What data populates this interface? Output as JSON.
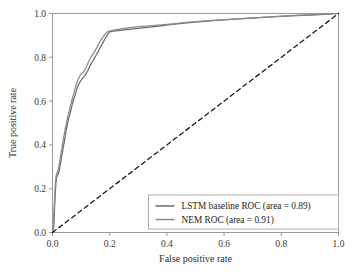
{
  "chart_data": {
    "type": "line",
    "title": "",
    "xlabel": "False positive rate",
    "ylabel": "True positive rate",
    "xlim": [
      0.0,
      1.0
    ],
    "ylim": [
      0.0,
      1.0
    ],
    "grid": false,
    "legend_position": "lower right",
    "xticks": [
      "0.0",
      "0.2",
      "0.4",
      "0.6",
      "0.8",
      "1.0"
    ],
    "yticks": [
      "0.0",
      "0.2",
      "0.4",
      "0.6",
      "0.8",
      "1.0"
    ],
    "xtick_values": [
      0.0,
      0.2,
      0.4,
      0.6,
      0.8,
      1.0
    ],
    "ytick_values": [
      0.0,
      0.2,
      0.4,
      0.6,
      0.8,
      1.0
    ],
    "series": [
      {
        "name": "LSTM baseline ROC (area = 0.89)",
        "area": 0.89,
        "color": "#6b6b6b",
        "linestyle": "solid",
        "points": [
          [
            0.0,
            0.0
          ],
          [
            0.004,
            0.02
          ],
          [
            0.006,
            0.075
          ],
          [
            0.008,
            0.13
          ],
          [
            0.01,
            0.185
          ],
          [
            0.012,
            0.225
          ],
          [
            0.014,
            0.25
          ],
          [
            0.018,
            0.262
          ],
          [
            0.022,
            0.275
          ],
          [
            0.026,
            0.3
          ],
          [
            0.03,
            0.33
          ],
          [
            0.034,
            0.36
          ],
          [
            0.038,
            0.392
          ],
          [
            0.042,
            0.42
          ],
          [
            0.046,
            0.452
          ],
          [
            0.05,
            0.48
          ],
          [
            0.054,
            0.508
          ],
          [
            0.058,
            0.528
          ],
          [
            0.062,
            0.545
          ],
          [
            0.066,
            0.568
          ],
          [
            0.07,
            0.59
          ],
          [
            0.074,
            0.608
          ],
          [
            0.078,
            0.622
          ],
          [
            0.082,
            0.64
          ],
          [
            0.086,
            0.66
          ],
          [
            0.09,
            0.672
          ],
          [
            0.094,
            0.682
          ],
          [
            0.098,
            0.692
          ],
          [
            0.104,
            0.702
          ],
          [
            0.11,
            0.712
          ],
          [
            0.116,
            0.722
          ],
          [
            0.122,
            0.735
          ],
          [
            0.128,
            0.752
          ],
          [
            0.134,
            0.768
          ],
          [
            0.14,
            0.782
          ],
          [
            0.146,
            0.795
          ],
          [
            0.152,
            0.808
          ],
          [
            0.158,
            0.822
          ],
          [
            0.164,
            0.838
          ],
          [
            0.17,
            0.852
          ],
          [
            0.176,
            0.866
          ],
          [
            0.182,
            0.88
          ],
          [
            0.188,
            0.894
          ],
          [
            0.194,
            0.906
          ],
          [
            0.2,
            0.916
          ],
          [
            0.212,
            0.92
          ],
          [
            0.23,
            0.922
          ],
          [
            0.26,
            0.926
          ],
          [
            0.3,
            0.932
          ],
          [
            0.34,
            0.938
          ],
          [
            0.38,
            0.944
          ],
          [
            0.42,
            0.95
          ],
          [
            0.46,
            0.956
          ],
          [
            0.5,
            0.961
          ],
          [
            0.55,
            0.966
          ],
          [
            0.6,
            0.971
          ],
          [
            0.65,
            0.975
          ],
          [
            0.7,
            0.979
          ],
          [
            0.75,
            0.983
          ],
          [
            0.8,
            0.987
          ],
          [
            0.85,
            0.99
          ],
          [
            0.9,
            0.993
          ],
          [
            0.95,
            0.996
          ],
          [
            1.0,
            1.0
          ]
        ]
      },
      {
        "name": "NEM ROC (area = 0.91)",
        "area": 0.91,
        "color": "#8a8a8a",
        "linestyle": "solid",
        "points": [
          [
            0.0,
            0.0
          ],
          [
            0.003,
            0.03
          ],
          [
            0.005,
            0.09
          ],
          [
            0.007,
            0.15
          ],
          [
            0.009,
            0.2
          ],
          [
            0.011,
            0.24
          ],
          [
            0.013,
            0.262
          ],
          [
            0.016,
            0.272
          ],
          [
            0.02,
            0.285
          ],
          [
            0.024,
            0.315
          ],
          [
            0.028,
            0.348
          ],
          [
            0.032,
            0.378
          ],
          [
            0.036,
            0.41
          ],
          [
            0.04,
            0.44
          ],
          [
            0.044,
            0.47
          ],
          [
            0.048,
            0.496
          ],
          [
            0.052,
            0.52
          ],
          [
            0.056,
            0.542
          ],
          [
            0.06,
            0.562
          ],
          [
            0.064,
            0.585
          ],
          [
            0.068,
            0.606
          ],
          [
            0.072,
            0.625
          ],
          [
            0.076,
            0.642
          ],
          [
            0.08,
            0.662
          ],
          [
            0.084,
            0.68
          ],
          [
            0.088,
            0.694
          ],
          [
            0.092,
            0.706
          ],
          [
            0.096,
            0.716
          ],
          [
            0.1,
            0.724
          ],
          [
            0.106,
            0.73
          ],
          [
            0.112,
            0.74
          ],
          [
            0.118,
            0.756
          ],
          [
            0.124,
            0.774
          ],
          [
            0.13,
            0.79
          ],
          [
            0.136,
            0.804
          ],
          [
            0.142,
            0.816
          ],
          [
            0.148,
            0.828
          ],
          [
            0.154,
            0.842
          ],
          [
            0.16,
            0.858
          ],
          [
            0.166,
            0.872
          ],
          [
            0.172,
            0.884
          ],
          [
            0.178,
            0.896
          ],
          [
            0.184,
            0.906
          ],
          [
            0.19,
            0.914
          ],
          [
            0.198,
            0.92
          ],
          [
            0.215,
            0.924
          ],
          [
            0.24,
            0.93
          ],
          [
            0.27,
            0.936
          ],
          [
            0.3,
            0.94
          ],
          [
            0.34,
            0.944
          ],
          [
            0.38,
            0.948
          ],
          [
            0.42,
            0.953
          ],
          [
            0.46,
            0.958
          ],
          [
            0.5,
            0.963
          ],
          [
            0.55,
            0.968
          ],
          [
            0.6,
            0.972
          ],
          [
            0.65,
            0.976
          ],
          [
            0.7,
            0.98
          ],
          [
            0.75,
            0.984
          ],
          [
            0.8,
            0.988
          ],
          [
            0.85,
            0.991
          ],
          [
            0.9,
            0.994
          ],
          [
            0.95,
            0.997
          ],
          [
            1.0,
            1.0
          ]
        ]
      },
      {
        "name": "chance-diagonal",
        "color": "#1a1a1a",
        "linestyle": "dashed",
        "points": [
          [
            0.0,
            0.0
          ],
          [
            1.0,
            1.0
          ]
        ]
      }
    ]
  },
  "legend": {
    "entries": [
      {
        "label": "LSTM baseline ROC (area = 0.89)",
        "color": "#6b6b6b"
      },
      {
        "label": "NEM ROC (area = 0.91)",
        "color": "#8a8a8a"
      }
    ]
  },
  "colors": {
    "axis": "#9a9a9a",
    "text": "#2e2e2e",
    "background": "#fefefe",
    "legend_border": "#a8a8a8"
  }
}
